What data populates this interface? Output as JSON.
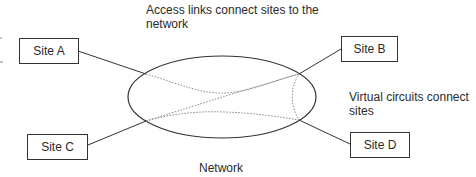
{
  "diagram": {
    "annotations": {
      "access_links": "Access links connect sites to the network",
      "virtual_circuits": "Virtual circuits connect sites",
      "network": "Network"
    },
    "sites": [
      {
        "id": "A",
        "label": "Site A"
      },
      {
        "id": "B",
        "label": "Site B"
      },
      {
        "id": "C",
        "label": "Site C"
      },
      {
        "id": "D",
        "label": "Site D"
      }
    ],
    "network_cloud": {
      "shape": "ellipse",
      "label": "Network"
    },
    "access_links": [
      {
        "from": "Site A",
        "to": "Network",
        "style": "solid"
      },
      {
        "from": "Site B",
        "to": "Network",
        "style": "solid"
      },
      {
        "from": "Site C",
        "to": "Network",
        "style": "solid"
      },
      {
        "from": "Site D",
        "to": "Network",
        "style": "solid"
      }
    ],
    "virtual_circuits": [
      {
        "from": "Site A",
        "to": "Site B",
        "style": "dotted"
      },
      {
        "from": "Site C",
        "to": "Site B",
        "style": "dotted"
      },
      {
        "from": "Site C",
        "to": "Site D",
        "style": "dotted"
      },
      {
        "from": "Site B",
        "to": "Site D",
        "style": "dotted"
      }
    ],
    "colors": {
      "line": "#333333",
      "dotted": "#888888",
      "text": "#2a2a2a"
    }
  }
}
